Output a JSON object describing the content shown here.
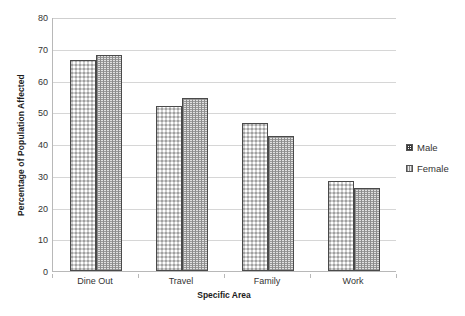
{
  "chart_data": {
    "type": "bar",
    "title": "",
    "subtitle": "",
    "xlabel": "Specific Area",
    "ylabel": "Percentage of Population Affected",
    "categories": [
      "Dine Out",
      "Travel",
      "Family",
      "Work"
    ],
    "series": [
      {
        "name": "Male",
        "values": [
          66.5,
          52.0,
          46.5,
          28.5
        ]
      },
      {
        "name": "Female",
        "values": [
          68.0,
          54.5,
          42.5,
          26.0
        ]
      }
    ],
    "ylim": [
      0,
      80
    ],
    "ytick_step": 10,
    "yticks": [
      "0",
      "10",
      "20",
      "30",
      "40",
      "50",
      "60",
      "70",
      "80"
    ],
    "grid": true,
    "grid_axis": "y",
    "legend_position": "right",
    "legend": [
      "Male",
      "Female"
    ],
    "colors": {
      "male_fill": "#2f2f2f",
      "female_fill": "#e2e2e2",
      "bar_border": "#4a4a4a",
      "gridline": "#d6d6d6",
      "axis": "#b8b8b8",
      "text": "#333333",
      "background": "#ffffff"
    }
  },
  "axes": {
    "y_title": "Percentage of Population Affected",
    "x_title": "Specific Area"
  },
  "legend": {
    "items": [
      {
        "label": "Male"
      },
      {
        "label": "Female"
      }
    ]
  }
}
